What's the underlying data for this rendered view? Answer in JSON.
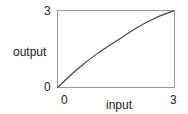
{
  "chart_data": {
    "type": "line",
    "title": "",
    "xlabel": "input",
    "ylabel": "output",
    "xlim": [
      0,
      3
    ],
    "ylim": [
      0,
      3
    ],
    "x_ticks": [
      "0",
      "3"
    ],
    "y_ticks": [
      "0",
      "3"
    ],
    "grid": false,
    "legend": null,
    "series": [
      {
        "name": "output",
        "x": [
          0,
          0.5,
          1.0,
          1.5,
          2.0,
          2.5,
          3.0
        ],
        "y": [
          0,
          0.7,
          1.3,
          1.8,
          2.3,
          2.7,
          3.0
        ]
      }
    ],
    "line_color": "#444444"
  }
}
